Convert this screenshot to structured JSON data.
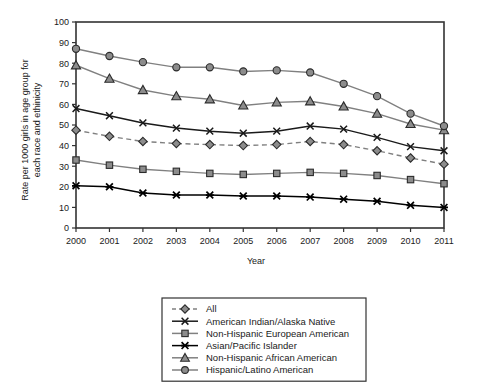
{
  "chart_data": {
    "type": "line",
    "title": "",
    "xlabel": "Year",
    "ylabel": "Rate per 1000 girls in age group for each race and ethnicity",
    "categories": [
      2000,
      2001,
      2002,
      2003,
      2004,
      2005,
      2006,
      2007,
      2008,
      2009,
      2010,
      2011
    ],
    "xlim": [
      2000,
      2011
    ],
    "ylim": [
      0,
      100
    ],
    "yticks": [
      0,
      10,
      20,
      30,
      40,
      50,
      60,
      70,
      80,
      90,
      100
    ],
    "grid": false,
    "legend_position": "below-center",
    "series": [
      {
        "name": "All",
        "marker": "diamond",
        "linestyle": "dashed",
        "color": "#808080",
        "values": [
          47.5,
          44.5,
          42.0,
          41.0,
          40.5,
          40.0,
          40.5,
          42.0,
          40.5,
          37.5,
          34.0,
          31.0
        ]
      },
      {
        "name": "American Indian/Alaska Native",
        "marker": "x",
        "linestyle": "solid",
        "color": "#1a1a1a",
        "values": [
          58.0,
          54.5,
          51.0,
          48.5,
          47.0,
          46.0,
          47.0,
          49.5,
          48.0,
          44.0,
          39.5,
          37.5
        ]
      },
      {
        "name": "Non-Hispanic European American",
        "marker": "square",
        "linestyle": "solid",
        "color": "#808080",
        "values": [
          33.0,
          30.5,
          28.5,
          27.5,
          26.5,
          26.0,
          26.5,
          27.0,
          26.5,
          25.5,
          23.5,
          21.5
        ]
      },
      {
        "name": "Asian/Pacific Islander",
        "marker": "asterisk",
        "linestyle": "solid",
        "color": "#000000",
        "values": [
          20.5,
          20.0,
          17.0,
          16.0,
          16.0,
          15.5,
          15.5,
          15.0,
          14.0,
          13.0,
          11.0,
          10.0
        ]
      },
      {
        "name": "Non-Hispanic African American",
        "marker": "triangle",
        "linestyle": "solid",
        "color": "#808080",
        "values": [
          79.0,
          72.5,
          67.0,
          64.0,
          62.5,
          59.5,
          61.0,
          61.5,
          59.0,
          55.5,
          50.5,
          47.5
        ]
      },
      {
        "name": "Hispanic/Latino American",
        "marker": "circle",
        "linestyle": "solid",
        "color": "#808080",
        "values": [
          87.0,
          83.5,
          80.5,
          78.0,
          78.0,
          76.0,
          76.5,
          75.5,
          70.0,
          64.0,
          55.5,
          49.5
        ]
      }
    ]
  },
  "axes": {
    "x_tick_labels": [
      "2000",
      "2001",
      "2002",
      "2003",
      "2004",
      "2005",
      "2006",
      "2007",
      "2008",
      "2009",
      "2010",
      "2011"
    ],
    "y_tick_labels": [
      "0",
      "10",
      "20",
      "30",
      "40",
      "50",
      "60",
      "70",
      "80",
      "90",
      "100"
    ],
    "x_axis_title": "Year",
    "y_axis_title_line1": "Rate per 1000 girls in age group for",
    "y_axis_title_line2": "each race and ethinicity"
  },
  "legend": {
    "items": [
      {
        "label": "All",
        "marker": "diamond",
        "linestyle": "dashed",
        "color": "#808080"
      },
      {
        "label": "American Indian/Alaska Native",
        "marker": "x",
        "linestyle": "solid",
        "color": "#1a1a1a"
      },
      {
        "label": "Non-Hispanic European American",
        "marker": "square",
        "linestyle": "solid",
        "color": "#808080"
      },
      {
        "label": "Asian/Pacific Islander",
        "marker": "asterisk",
        "linestyle": "solid",
        "color": "#000000"
      },
      {
        "label": "Non-Hispanic African American",
        "marker": "triangle",
        "linestyle": "solid",
        "color": "#808080"
      },
      {
        "label": "Hispanic/Latino American",
        "marker": "circle",
        "linestyle": "solid",
        "color": "#808080"
      }
    ]
  },
  "style": {
    "background": "#ffffff",
    "axis_color": "#333333",
    "marker_fill": "#8c8c8c",
    "marker_stroke": "#2b2b2b",
    "text_color": "#1a1a1a"
  }
}
